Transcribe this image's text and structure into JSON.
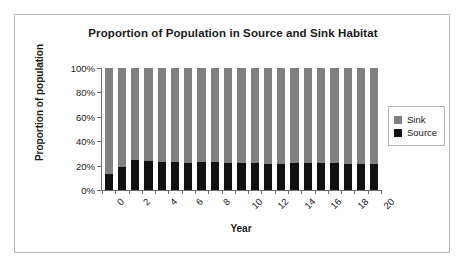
{
  "chart_data": {
    "type": "bar",
    "stacked": true,
    "normalized": true,
    "title": "Proportion of Population in Source and Sink Habitat",
    "xlabel": "Year",
    "ylabel": "Proportion of population",
    "ylim": [
      0,
      100
    ],
    "ytick_labels": [
      "0%",
      "20%",
      "40%",
      "60%",
      "80%",
      "100%"
    ],
    "ytick_values": [
      0,
      20,
      40,
      60,
      80,
      100
    ],
    "grid": false,
    "legend_position": "right",
    "categories": [
      0,
      1,
      2,
      3,
      4,
      5,
      6,
      7,
      8,
      9,
      10,
      11,
      12,
      13,
      14,
      15,
      16,
      17,
      18,
      19,
      20
    ],
    "xtick_labels": [
      "0",
      "2",
      "4",
      "6",
      "8",
      "10",
      "12",
      "14",
      "16",
      "18",
      "20"
    ],
    "xtick_label_rotation": -45,
    "series": [
      {
        "name": "Source",
        "color": "#111111",
        "values": [
          13,
          19,
          25,
          24,
          23,
          23,
          22,
          23,
          23,
          22,
          22,
          22,
          21,
          21,
          22,
          22,
          22,
          22,
          21,
          21,
          21
        ]
      },
      {
        "name": "Sink",
        "color": "#808080",
        "values": [
          87,
          81,
          75,
          76,
          77,
          77,
          78,
          77,
          77,
          78,
          78,
          78,
          79,
          79,
          78,
          78,
          78,
          78,
          79,
          79,
          79
        ]
      }
    ]
  },
  "legend": {
    "entries": [
      {
        "label": "Sink",
        "color": "#808080"
      },
      {
        "label": "Source",
        "color": "#111111"
      }
    ]
  }
}
